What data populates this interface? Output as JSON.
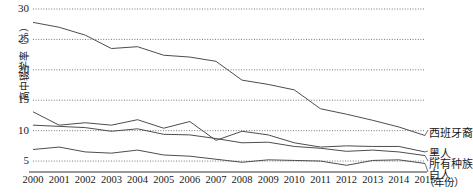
{
  "chart_data": {
    "type": "line",
    "title": "",
    "xlabel": "（年份）",
    "ylabel": "高中辍学率（%）",
    "x": [
      2000,
      2001,
      2002,
      2003,
      2004,
      2005,
      2006,
      2007,
      2008,
      2009,
      2010,
      2011,
      2012,
      2013,
      2014,
      2015
    ],
    "xtick_labels": [
      "2000",
      "2001",
      "2002",
      "2003",
      "2004",
      "2005",
      "2006",
      "2007",
      "2008",
      "2009",
      "2010",
      "2011",
      "2012",
      "2013",
      "2014",
      "2015"
    ],
    "ytick_labels": [
      "5",
      "10",
      "15",
      "20",
      "25",
      "30"
    ],
    "yticks": [
      5,
      10,
      15,
      20,
      25,
      30
    ],
    "ylim": [
      3.2,
      30
    ],
    "xlim": [
      2000,
      2015
    ],
    "grid": "horizontal-dotted",
    "legend_position": "right-inline-labels",
    "series": [
      {
        "name": "西班牙裔",
        "label": "西班牙裔",
        "color": "#4d4d4d",
        "values": [
          27.8,
          27.0,
          25.7,
          23.5,
          23.8,
          22.4,
          22.1,
          21.4,
          18.3,
          17.6,
          16.7,
          13.6,
          12.7,
          11.7,
          10.6,
          9.2
        ]
      },
      {
        "name": "黑人",
        "label": "黑人",
        "color": "#4d4d4d",
        "values": [
          13.1,
          10.9,
          11.3,
          10.9,
          11.8,
          10.4,
          11.5,
          8.4,
          9.9,
          9.3,
          8.0,
          7.3,
          7.5,
          7.4,
          7.4,
          6.5
        ]
      },
      {
        "name": "所有种族",
        "label": "所有种族",
        "color": "#4d4d4d",
        "values": [
          10.9,
          10.7,
          10.5,
          9.9,
          10.3,
          9.4,
          9.3,
          8.7,
          8.0,
          8.1,
          7.4,
          7.1,
          6.6,
          6.8,
          6.5,
          5.9
        ]
      },
      {
        "name": "白人",
        "label": "白人",
        "color": "#4d4d4d",
        "values": [
          6.9,
          7.3,
          6.5,
          6.3,
          6.8,
          6.0,
          5.8,
          5.3,
          4.8,
          5.2,
          5.1,
          5.0,
          4.3,
          5.1,
          5.2,
          4.6
        ]
      }
    ]
  }
}
